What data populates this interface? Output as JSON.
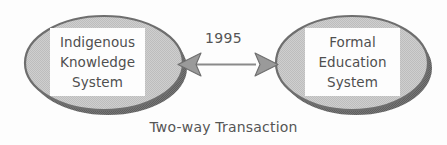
{
  "figure": {
    "type": "diagram",
    "subtype": "two-node relationship diagram",
    "background_color": "#fdfdfd",
    "caption": "Two-way Transaction"
  },
  "nodes": [
    {
      "id": "indigenous-knowledge-system",
      "shape": "ellipse",
      "fill_color": "#c9c9c9",
      "border_color": "#6e6e6e",
      "shadow_color": "#6b6b6b",
      "text_box_color": "#fdfdfd",
      "text_color": "#4f4f4f",
      "lines": [
        "Indigenous",
        "Knowledge",
        "System"
      ]
    },
    {
      "id": "formal-education-system",
      "shape": "ellipse",
      "fill_color": "#c9c9c9",
      "border_color": "#6e6e6e",
      "shadow_color": "#6b6b6b",
      "text_box_color": "#fdfdfd",
      "text_color": "#4f4f4f",
      "lines": [
        "Formal",
        "Education",
        "System"
      ]
    }
  ],
  "edge": {
    "id": "two-way-arrow",
    "style": "double-headed",
    "label": "1995",
    "line_color": "#8a8a8a",
    "head_fill_color": "#9a9a9a",
    "head_border_color": "#6e6e6e",
    "from": "indigenous-knowledge-system",
    "to": "formal-education-system"
  }
}
